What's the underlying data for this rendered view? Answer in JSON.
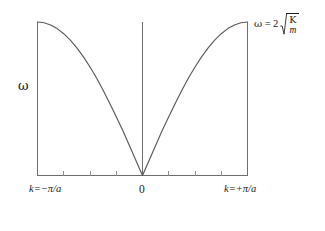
{
  "figure": {
    "kind": "phonon-dispersion-plot",
    "background_color": "#ffffff",
    "line_color": "#595959",
    "axis_color": "#6e6e6e",
    "text_color": "#1a1a1a"
  },
  "labels": {
    "y_axis": "ω",
    "x_tick_left": "k=−π/a",
    "x_tick_center": "0",
    "x_tick_right": "k=+π/a",
    "max_frequency": {
      "omega": "ω",
      "equals": "=",
      "coefficient": "2",
      "radicand_numerator": "Κ",
      "radicand_denominator": "m",
      "full_text": "ω = 2√(Κ/m)"
    }
  },
  "icons": {
    "radical_sign": "radical-icon",
    "fraction_bar": "fraction-bar-icon"
  },
  "chart_data": {
    "type": "line",
    "title": "",
    "subtitle": "",
    "xlabel": "",
    "ylabel": "ω",
    "xlim": [
      -3.141592653589793,
      3.141592653589793
    ],
    "ylim": [
      0,
      2
    ],
    "grid": false,
    "legend": null,
    "equation": "ω = 2√(Κ/m) |sin(ka/2)|",
    "x_tick_labels": [
      "k=−π/a",
      "0",
      "k=+π/a"
    ],
    "x_tick_values": [
      -3.141592653589793,
      0,
      3.141592653589793
    ],
    "minor_tick_count": 8,
    "y_tick_labels": [],
    "annotations": [
      {
        "text": "ω = 2√(Κ/m)",
        "x": 3.141592653589793,
        "y": 2.0,
        "position": "top-right",
        "describes": "maximum angular frequency at zone boundary"
      }
    ],
    "series": [
      {
        "name": "acoustic branch",
        "x": [
          -3.1416,
          -2.9452,
          -2.7489,
          -2.5525,
          -2.3562,
          -2.1598,
          -1.9635,
          -1.7671,
          -1.5708,
          -1.3744,
          -1.1781,
          -0.9817,
          -0.7854,
          -0.589,
          -0.3927,
          -0.1963,
          0.0,
          0.1963,
          0.3927,
          0.589,
          0.7854,
          0.9817,
          1.1781,
          1.3744,
          1.5708,
          1.7671,
          1.9635,
          2.1598,
          2.3562,
          2.5525,
          2.7489,
          2.9452,
          3.1416
        ],
        "y": [
          2.0,
          1.9904,
          1.9616,
          1.9139,
          1.8478,
          1.7642,
          1.6629,
          1.5451,
          1.4142,
          1.2699,
          1.1112,
          0.941,
          0.7654,
          0.5853,
          0.3902,
          0.196,
          0.0,
          0.196,
          0.3902,
          0.5853,
          0.7654,
          0.941,
          1.1112,
          1.2699,
          1.4142,
          1.5451,
          1.6629,
          1.7642,
          1.8478,
          1.9139,
          1.9616,
          1.9904,
          2.0
        ]
      }
    ]
  }
}
